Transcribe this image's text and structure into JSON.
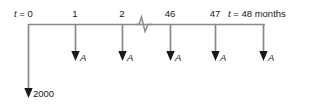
{
  "diagram": {
    "type": "cash-flow-timeline",
    "title": "",
    "axis": {
      "line_y": 24,
      "start_x": 28,
      "end_x": 265,
      "break_marker_x": 143,
      "break_marker": "zigzag-break"
    },
    "colors": {
      "stem": "#8a8a8a",
      "arrowhead": "#1a1a1a",
      "axis": "#8a8a8a",
      "text": "#161616",
      "background": "#ffffff"
    },
    "time_labels": [
      {
        "id": "t0",
        "text_prefix": "t",
        "text": "t = 0",
        "value": 0,
        "x": 28,
        "centered": false,
        "left": 14,
        "italic_lead": true
      },
      {
        "id": "t1",
        "text": "1",
        "value": 1,
        "x": 75,
        "centered": true
      },
      {
        "id": "t2",
        "text": "2",
        "value": 2,
        "x": 122,
        "centered": true
      },
      {
        "id": "t46",
        "text": "46",
        "value": 46,
        "x": 170,
        "centered": true
      },
      {
        "id": "t47",
        "text": "47",
        "value": 47,
        "x": 215,
        "centered": true
      },
      {
        "id": "t48",
        "text": "t = 48 months",
        "value": 48,
        "x": 263,
        "centered": false,
        "left": 228,
        "italic_lead": true
      }
    ],
    "cash_flows": [
      {
        "id": "cf-0",
        "period": 0,
        "x": 28,
        "direction": "down",
        "length": "long",
        "tip_y": 97,
        "label": "2000",
        "label_italic": false,
        "label_x": 33,
        "label_y": 88
      },
      {
        "id": "cf-1",
        "period": 1,
        "x": 75,
        "direction": "down",
        "length": "short",
        "tip_y": 60,
        "label": "A",
        "label_italic": true,
        "label_x": 80,
        "label_y": 52
      },
      {
        "id": "cf-2",
        "period": 2,
        "x": 122,
        "direction": "down",
        "length": "short",
        "tip_y": 60,
        "label": "A",
        "label_italic": true,
        "label_x": 127,
        "label_y": 52
      },
      {
        "id": "cf-46",
        "period": 46,
        "x": 170,
        "direction": "down",
        "length": "short",
        "tip_y": 60,
        "label": "A",
        "label_italic": true,
        "label_x": 175,
        "label_y": 52
      },
      {
        "id": "cf-47",
        "period": 47,
        "x": 215,
        "direction": "down",
        "length": "short",
        "tip_y": 60,
        "label": "A",
        "label_italic": true,
        "label_x": 220,
        "label_y": 52
      },
      {
        "id": "cf-48",
        "period": 48,
        "x": 263,
        "direction": "down",
        "length": "short",
        "tip_y": 60,
        "label": "A",
        "label_italic": true,
        "label_x": 268,
        "label_y": 52
      }
    ],
    "units": "months",
    "initial_amount": "2000",
    "payment_symbol": "A"
  }
}
